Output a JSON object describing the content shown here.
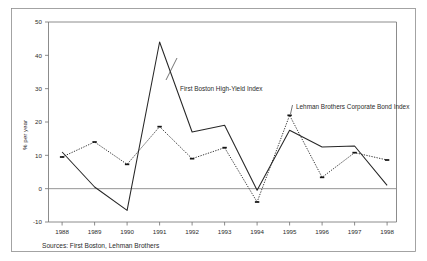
{
  "chart_data": {
    "type": "line",
    "title": "",
    "xlabel": "",
    "ylabel": "% per year",
    "categories": [
      "1988",
      "1989",
      "1990",
      "1991",
      "1992",
      "1993",
      "1994",
      "1995",
      "1996",
      "1997",
      "1998"
    ],
    "x": [
      1988,
      1989,
      1990,
      1991,
      1992,
      1993,
      1994,
      1995,
      1996,
      1997,
      1998
    ],
    "ylim": [
      -10,
      50
    ],
    "yticks": [
      -10,
      0,
      10,
      20,
      30,
      40,
      50
    ],
    "ytick_labels": [
      "-10",
      "0",
      "10",
      "20",
      "30",
      "40",
      "50"
    ],
    "grid": false,
    "legend_position": "inline-annotations",
    "zero_line": 0,
    "series": [
      {
        "name": "First Boston High-Yield Index",
        "style": "solid",
        "markers": false,
        "values": [
          11,
          0.5,
          -6.5,
          44,
          17,
          19,
          -0.5,
          17.5,
          12.5,
          12.8,
          1
        ]
      },
      {
        "name": "Lehman Brothers Corporate Bond Index",
        "style": "dotted",
        "markers": true,
        "values": [
          9.5,
          14,
          7.3,
          18.6,
          9,
          12.3,
          -4,
          22,
          3.4,
          10.8,
          8.6
        ]
      }
    ],
    "annotations": [
      {
        "text": "First Boston High-Yield Index",
        "x": 1991.55,
        "y": 27.5,
        "anchor": "start"
      },
      {
        "text": "Lehman Brothers Corporate Bond Index",
        "x": 1995.1,
        "y": 23.3,
        "anchor": "start"
      }
    ]
  },
  "footer": {
    "source_note": "Sources: First Boston, Lehman Brothers"
  },
  "axes": {
    "y_axis_title": "% per year"
  }
}
